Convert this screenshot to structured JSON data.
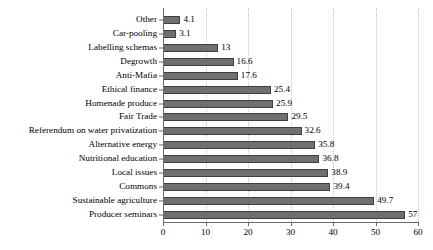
{
  "chart_data": {
    "type": "bar",
    "orientation": "horizontal",
    "title": "",
    "subtitle": "",
    "xlabel": "",
    "ylabel": "",
    "xlim": [
      0,
      60
    ],
    "grid": "vertical-dotted",
    "legend": "none",
    "bar_color": "#6f6f6f",
    "bar_border_color": "#3f3f3f",
    "gridline_color": "#c8c8c8",
    "axis_color": "#6a6a6a",
    "data_labels_shown": true,
    "categories": [
      "Other",
      "Car-pooling",
      "Labelling schemas",
      "Degrowth",
      "Anti-Mafia",
      "Ethical finance",
      "Homenade produce",
      "Fair Trade",
      "Referendum on water privatization",
      "Alternative energy",
      "Nutritional education",
      "Local issues",
      "Commons",
      "Sustainable agriculture",
      "Producer seminars"
    ],
    "values": [
      4.1,
      3.1,
      13,
      16.6,
      17.6,
      25.4,
      25.9,
      29.5,
      32.6,
      35.8,
      36.8,
      38.9,
      39.4,
      49.7,
      57
    ],
    "value_labels": [
      "4.1",
      "3.1",
      "13",
      "16.6",
      "17.6",
      "25.4",
      "25.9",
      "29.5",
      "32.6",
      "35.8",
      "36.8",
      "38.9",
      "39.4",
      "49.7",
      "57"
    ],
    "xticks": [
      0,
      10,
      20,
      30,
      40,
      50,
      60
    ],
    "xtick_labels": [
      "0",
      "10",
      "20",
      "30",
      "40",
      "50",
      "60"
    ]
  }
}
